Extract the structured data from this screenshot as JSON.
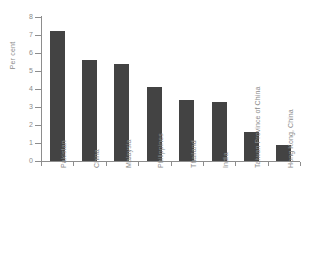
{
  "chart_data": {
    "type": "bar",
    "title": "",
    "subtitle": "",
    "xlabel": "",
    "ylabel": "Per cent",
    "categories": [
      "Pakistan",
      "China",
      "Malaysia",
      "Philippines",
      "Thailand",
      "India",
      "Taiwan Province of China",
      "Hong Kong, China"
    ],
    "values": [
      7.2,
      5.6,
      5.4,
      4.1,
      3.4,
      3.3,
      1.6,
      0.9
    ],
    "ylim": [
      0,
      8
    ],
    "ytick_labels": [
      "0",
      "1",
      "2",
      "3",
      "4",
      "5",
      "6",
      "7",
      "8"
    ],
    "ytick_values": [
      0,
      1,
      2,
      3,
      4,
      5,
      6,
      7,
      8
    ],
    "grid": false,
    "legend": null,
    "bar_color": "#434343",
    "axis_color": "#8d8d8d",
    "text_color": "#8a8a8a",
    "background_color": "#ffffff"
  }
}
